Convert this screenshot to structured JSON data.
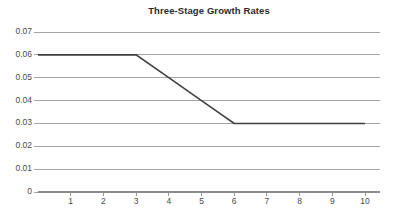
{
  "chart_data": {
    "type": "line",
    "title": "Three-Stage Growth Rates",
    "xlabel": "",
    "ylabel": "",
    "x": [
      0,
      1,
      2,
      3,
      4,
      5,
      6,
      7,
      8,
      9,
      10
    ],
    "series": [
      {
        "name": "Growth Rate",
        "values": [
          0.06,
          0.06,
          0.06,
          0.06,
          0.05,
          0.04,
          0.03,
          0.03,
          0.03,
          0.03,
          0.03
        ]
      }
    ],
    "xlim": [
      0,
      10.5
    ],
    "ylim": [
      0,
      0.07
    ],
    "x_tick_labels": [
      "1",
      "2",
      "3",
      "4",
      "5",
      "6",
      "7",
      "8",
      "9",
      "10"
    ],
    "x_tick_values": [
      1,
      2,
      3,
      4,
      5,
      6,
      7,
      8,
      9,
      10
    ],
    "y_tick_labels": [
      "0",
      "0.01",
      "0.02",
      "0.03",
      "0.04",
      "0.05",
      "0.06",
      "0.07"
    ],
    "y_tick_values": [
      0,
      0.01,
      0.02,
      0.03,
      0.04,
      0.05,
      0.06,
      0.07
    ],
    "grid": "horizontal",
    "legend": "none",
    "annotations": [],
    "colors": {
      "line": "#3f3f3f",
      "grid": "#9a9a9a",
      "axis": "#8c8c8c",
      "title_text": "#2b2b2b",
      "tick_text": "#4a4a4a",
      "background": "#ffffff"
    }
  }
}
